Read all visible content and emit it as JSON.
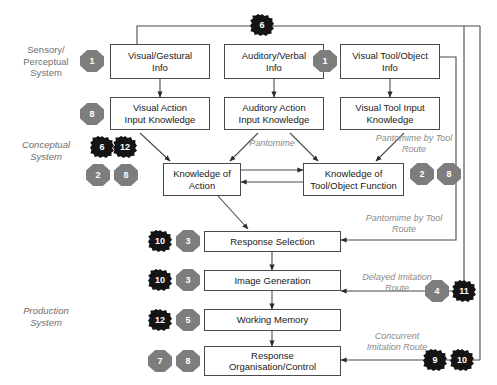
{
  "diagram": {
    "colors": {
      "box_border": "#4a4a4a",
      "badge_gray": "#7d7d7d",
      "badge_dark": "#141414",
      "line": "#4a4a4a",
      "route_label": "#8a8a8a",
      "system_label": "#6f6f6f"
    }
  },
  "system_labels": [
    {
      "id": "sensory",
      "text": "Sensory/\nPerceptual\nSystem",
      "italic": false
    },
    {
      "id": "conceptual",
      "text": "Conceptual\nSystem",
      "italic": true
    },
    {
      "id": "production",
      "text": "Production\nSystem",
      "italic": true
    }
  ],
  "boxes": [
    {
      "id": "visual-gestural-info",
      "label": "Visual/Gestural\nInfo"
    },
    {
      "id": "auditory-verbal-info",
      "label": "Auditory/Verbal\nInfo"
    },
    {
      "id": "visual-tool-object-info",
      "label": "Visual Tool/Object\nInfo"
    },
    {
      "id": "visual-action-input-knowledge",
      "label": "Visual Action\nInput Knowledge"
    },
    {
      "id": "auditory-action-input-knowledge",
      "label": "Auditory Action\nInput Knowledge"
    },
    {
      "id": "visual-tool-input-knowledge",
      "label": "Visual Tool Input\nKnowledge"
    },
    {
      "id": "knowledge-of-action",
      "label": "Knowledge of\nAction"
    },
    {
      "id": "knowledge-of-tool-object-function",
      "label": "Knowledge of\nTool/Object Function"
    },
    {
      "id": "response-selection",
      "label": "Response Selection"
    },
    {
      "id": "image-generation",
      "label": "Image Generation"
    },
    {
      "id": "working-memory",
      "label": "Working Memory"
    },
    {
      "id": "response-organisation-control",
      "label": "Response\nOrganisation/Control"
    }
  ],
  "route_labels": [
    {
      "id": "pantomime",
      "text": "Pantomime"
    },
    {
      "id": "pantomime-by-tool-route-upper",
      "text": "Pantomime by Tool\nRoute"
    },
    {
      "id": "pantomime-by-tool-route-lower",
      "text": "Pantomime by Tool\nRoute"
    },
    {
      "id": "delayed-imitation-route",
      "text": "Delayed Imitation\nRoute"
    },
    {
      "id": "concurrent-imitation-route",
      "text": "Concurrent\nImitation Route"
    }
  ],
  "badges": [
    {
      "id": "badge-top-6",
      "value": "6",
      "style": "dark"
    },
    {
      "id": "badge-sensory-1",
      "value": "1",
      "style": "gray"
    },
    {
      "id": "badge-tool-1",
      "value": "1",
      "style": "gray"
    },
    {
      "id": "badge-visual-action-8",
      "value": "8",
      "style": "gray"
    },
    {
      "id": "badge-conceptual-6",
      "value": "6",
      "style": "dark"
    },
    {
      "id": "badge-conceptual-12",
      "value": "12",
      "style": "dark"
    },
    {
      "id": "badge-conceptual-2",
      "value": "2",
      "style": "gray"
    },
    {
      "id": "badge-conceptual-8",
      "value": "8",
      "style": "gray"
    },
    {
      "id": "badge-tool-function-2",
      "value": "2",
      "style": "gray"
    },
    {
      "id": "badge-tool-function-8",
      "value": "8",
      "style": "gray"
    },
    {
      "id": "badge-response-selection-10",
      "value": "10",
      "style": "dark"
    },
    {
      "id": "badge-response-selection-3",
      "value": "3",
      "style": "gray"
    },
    {
      "id": "badge-image-generation-10",
      "value": "10",
      "style": "dark"
    },
    {
      "id": "badge-image-generation-3",
      "value": "3",
      "style": "gray"
    },
    {
      "id": "badge-working-memory-12",
      "value": "12",
      "style": "dark"
    },
    {
      "id": "badge-working-memory-5",
      "value": "5",
      "style": "gray"
    },
    {
      "id": "badge-response-org-7",
      "value": "7",
      "style": "gray"
    },
    {
      "id": "badge-response-org-8",
      "value": "8",
      "style": "gray"
    },
    {
      "id": "badge-delayed-4",
      "value": "4",
      "style": "gray"
    },
    {
      "id": "badge-delayed-11",
      "value": "11",
      "style": "dark"
    },
    {
      "id": "badge-concurrent-9",
      "value": "9",
      "style": "dark"
    },
    {
      "id": "badge-concurrent-10",
      "value": "10",
      "style": "dark"
    }
  ]
}
